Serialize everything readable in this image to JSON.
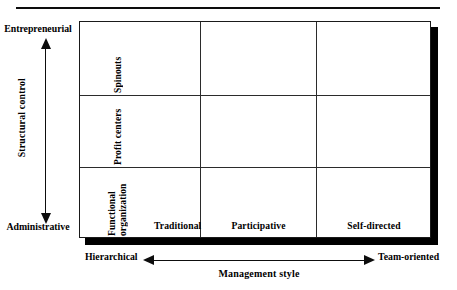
{
  "figure": {
    "top_rule": true
  },
  "y_axis": {
    "title": "Structural control",
    "high_label": "Entrepreneurial",
    "low_label": "Administrative",
    "direction": "double-headed-vertical"
  },
  "x_axis": {
    "title": "Management style",
    "low_label": "Hierarchical",
    "high_label": "Team-oriented",
    "direction": "double-headed-horizontal"
  },
  "matrix": {
    "row_labels": [
      "Spinouts",
      "Profit centers",
      "Functional\norganization"
    ],
    "column_labels": [
      "Traditional",
      "Participative",
      "Self-directed"
    ],
    "cells": [
      [
        "",
        "",
        ""
      ],
      [
        "",
        "",
        ""
      ],
      [
        "",
        "",
        ""
      ]
    ]
  },
  "colors": {
    "line": "#1a1a1a",
    "shadow": "#000000",
    "text": "#000000",
    "background": "#ffffff"
  }
}
